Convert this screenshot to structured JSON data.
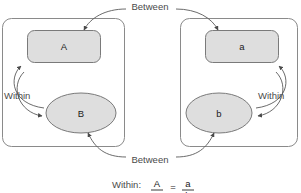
{
  "diagram": {
    "type": "within-between-group-comparison",
    "background_color": "#ffffff",
    "shape_fill_color": "#dedede",
    "shape_stroke_color": "#7a7a7a",
    "box_stroke_color": "#8a8a8a",
    "label_color": "#4a4a4a",
    "groups": [
      {
        "id": "left-group",
        "name": "uppercase-group",
        "top_shape": {
          "name": "rect-A",
          "label": "A",
          "shape": "rounded-rectangle"
        },
        "bottom_shape": {
          "name": "ellipse-B",
          "label": "B",
          "shape": "ellipse"
        },
        "within_label": "Within"
      },
      {
        "id": "right-group",
        "name": "lowercase-group",
        "top_shape": {
          "name": "rect-a",
          "label": "a",
          "shape": "rounded-rectangle"
        },
        "bottom_shape": {
          "name": "ellipse-b",
          "label": "b",
          "shape": "ellipse"
        },
        "within_label": "Within"
      }
    ],
    "between_top_label": "Between",
    "between_bottom_label": "Between",
    "formula": {
      "prefix": "Within:",
      "left_numerator": "A",
      "left_denominator": "B",
      "equals": "=",
      "right_numerator": "a",
      "right_denominator": "b"
    }
  }
}
